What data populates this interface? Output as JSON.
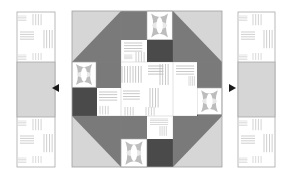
{
  "diagram": {
    "colors": {
      "background": "#ffffff",
      "light_gray": "#d4d4d4",
      "mid_gray": "#7a7a7a",
      "dark_gray": "#4a4a4a",
      "white_patch": "#ffffff",
      "stripe": "#c8c8c8",
      "outline": "#a8a8a8",
      "arrow": "#1a1a1a"
    },
    "center_block": {
      "label": "Center block",
      "patches": {
        "corner_triangles": 4,
        "flower_patches": 4,
        "dark_squares": 4,
        "striped_patches": 8
      }
    },
    "left_strip": {
      "label": "Left side strip",
      "sections": [
        "striped",
        "light gray",
        "striped"
      ]
    },
    "right_strip": {
      "label": "Right side strip",
      "sections": [
        "striped",
        "light gray",
        "striped"
      ]
    },
    "arrows": [
      {
        "direction": "left",
        "label": "Attach left strip"
      },
      {
        "direction": "right",
        "label": "Attach right strip"
      }
    ]
  }
}
